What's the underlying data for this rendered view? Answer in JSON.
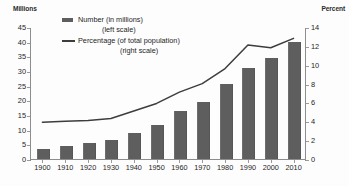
{
  "axes": {
    "left_title": "Millions",
    "right_title": "Percent",
    "left_ticks": [
      "45",
      "40",
      "35",
      "30",
      "25",
      "20",
      "15",
      "10",
      "5",
      "0"
    ],
    "right_ticks": [
      "14",
      "12",
      "10",
      "8",
      "6",
      "4",
      "2",
      "0"
    ]
  },
  "legend": {
    "number_label": "Number (in millions)",
    "number_sub": "(left scale)",
    "percentage_label": "Percentage (of total population)",
    "percentage_sub": "(right scale)",
    "bar_swatch_icon": "filled-rectangle-icon",
    "line_swatch_icon": "horizontal-line-icon"
  },
  "colors": {
    "bar": "#5e5e5e",
    "line": "#3d3d3d",
    "axis": "#8d8d8d",
    "text": "#1d1d1d",
    "background": "#fdfdfd"
  },
  "chart_data": {
    "type": "bar",
    "title": "",
    "subtitle": "",
    "xlabel": "",
    "ylabel": "Millions",
    "y2label": "Percent",
    "categories": [
      "1900",
      "1910",
      "1920",
      "1930",
      "1940",
      "1950",
      "1960",
      "1970",
      "1980",
      "1990",
      "2000",
      "2010"
    ],
    "ylim": [
      0,
      45
    ],
    "y2lim": [
      0,
      14
    ],
    "yticks": [
      0,
      5,
      10,
      15,
      20,
      25,
      30,
      35,
      40,
      45
    ],
    "y2ticks": [
      0,
      2,
      4,
      6,
      8,
      10,
      12,
      14
    ],
    "grid": false,
    "legend_position": "top-center",
    "series": [
      {
        "name": "Number (in millions)",
        "type": "bar",
        "axis": "left",
        "values": [
          3.5,
          4.5,
          5.5,
          6.5,
          9.0,
          11.5,
          16.5,
          19.5,
          25.5,
          31.0,
          34.5,
          40.0
        ]
      },
      {
        "name": "Percentage (of total population)",
        "type": "line",
        "axis": "right",
        "values": [
          4.0,
          4.1,
          4.2,
          4.4,
          5.2,
          6.0,
          7.2,
          8.1,
          9.7,
          12.2,
          11.9,
          12.9
        ]
      }
    ]
  }
}
